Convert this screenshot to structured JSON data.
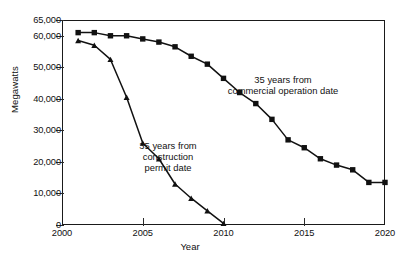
{
  "chart_data": {
    "type": "line",
    "title": "",
    "xlabel": "Year",
    "ylabel": "Megawatts",
    "xlim": [
      2000,
      2020
    ],
    "ylim": [
      0,
      65000
    ],
    "xticks": [
      2000,
      2005,
      2010,
      2015,
      2020
    ],
    "xtick_labels": [
      "2000",
      "2005",
      "2010",
      "2015",
      "2020"
    ],
    "yticks": [
      0,
      10000,
      20000,
      30000,
      40000,
      50000,
      60000,
      65000
    ],
    "ytick_labels": [
      "0",
      "10,000",
      "20,000",
      "30,000",
      "40,000",
      "50,000",
      "60,000",
      "65,000"
    ],
    "grid": false,
    "legend": "annotations-inline",
    "series": [
      {
        "name": "35 years from commercial operation date",
        "marker": "square",
        "color": "#111111",
        "x": [
          2001,
          2002,
          2003,
          2004,
          2005,
          2006,
          2007,
          2008,
          2009,
          2010,
          2011,
          2012,
          2013,
          2014,
          2015,
          2016,
          2017,
          2018,
          2019,
          2020
        ],
        "values": [
          61000,
          61000,
          60000,
          60000,
          59000,
          58000,
          56500,
          53500,
          51000,
          46500,
          42000,
          38500,
          33500,
          27000,
          24500,
          21000,
          19000,
          17500,
          13500,
          13500
        ]
      },
      {
        "name": "35 years from construction permit date",
        "marker": "triangle",
        "color": "#111111",
        "x": [
          2001,
          2002,
          2003,
          2004,
          2005,
          2006,
          2007,
          2008,
          2009,
          2010
        ],
        "values": [
          58500,
          57000,
          52500,
          40500,
          26000,
          21000,
          13000,
          8500,
          4500,
          500
        ]
      }
    ],
    "annotations": [
      {
        "id": "commercial",
        "text": "35 years from\ncommercial operation date"
      },
      {
        "id": "construction",
        "text": "35 years from\nconstruction\npermit date"
      }
    ]
  }
}
